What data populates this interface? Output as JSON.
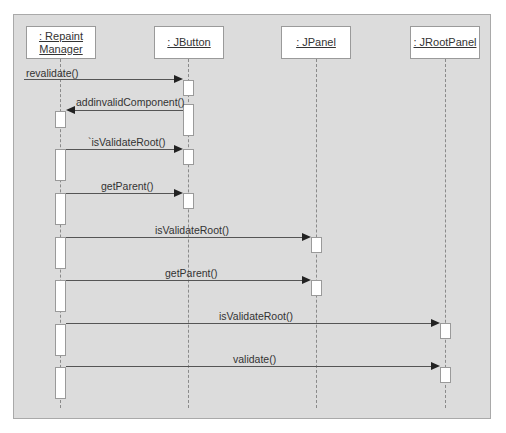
{
  "diagram": {
    "type": "sequence",
    "objects": [
      {
        "id": "repaint_manager",
        "label_line1": ": Repaint",
        "label_line2": "Manager"
      },
      {
        "id": "jbutton",
        "label": ": JButton"
      },
      {
        "id": "jpanel",
        "label": ": JPanel"
      },
      {
        "id": "jrootpanel",
        "label": ": JRootPanel"
      }
    ],
    "messages": [
      {
        "label": "revalidate()",
        "from": "external",
        "to": "jbutton"
      },
      {
        "label": "addinvalidComponent()",
        "from": "jbutton",
        "to": "repaint_manager"
      },
      {
        "label": "`isValidateRoot()",
        "from": "repaint_manager",
        "to": "jbutton"
      },
      {
        "label": "getParent()",
        "from": "repaint_manager",
        "to": "jbutton"
      },
      {
        "label": "isValidateRoot()",
        "from": "repaint_manager",
        "to": "jpanel"
      },
      {
        "label": "getParent()",
        "from": "repaint_manager",
        "to": "jpanel"
      },
      {
        "label": "isValidateRoot()",
        "from": "repaint_manager",
        "to": "jrootpanel"
      },
      {
        "label": "validate()",
        "from": "repaint_manager",
        "to": "jrootpanel"
      }
    ]
  }
}
